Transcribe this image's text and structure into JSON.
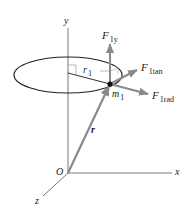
{
  "diagram": {
    "type": "3d-vector-diagram",
    "axes": {
      "x_label": "x",
      "y_label": "y",
      "z_label": "z",
      "origin_label": "O"
    },
    "circle": {
      "radius_label": "r",
      "radius_subscript": "1"
    },
    "mass": {
      "label": "m",
      "subscript": "1"
    },
    "position_vector": {
      "label": "r"
    },
    "forces": [
      {
        "label": "F",
        "subscript": "1y"
      },
      {
        "label": "F",
        "subscript": "1tan"
      },
      {
        "label": "F",
        "subscript": "1rad"
      }
    ],
    "colors": {
      "axis": "#555555",
      "ellipse": "#222222",
      "vector": "#8a8a8a",
      "point": "#111111",
      "background": "#ffffff"
    }
  }
}
